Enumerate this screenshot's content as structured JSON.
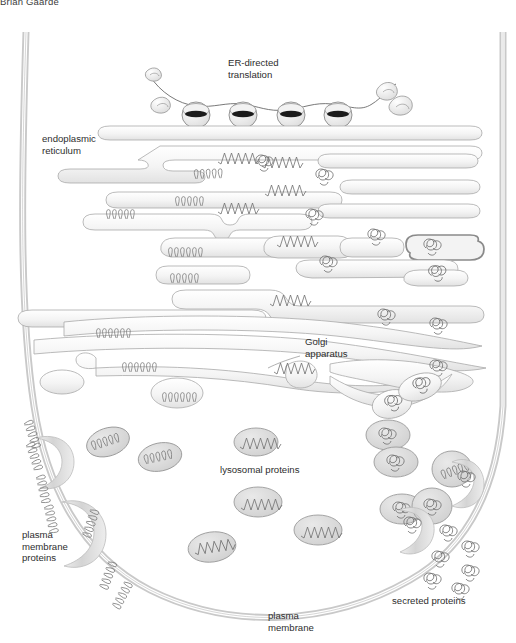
{
  "breadcrumb": {
    "text": "Brian Gaarde"
  },
  "figure": {
    "background_color": "#ffffff",
    "ink_color": "#6e6e6e",
    "membrane_fill": "#dcdcdc",
    "vesicle_fill": "#d6d6d6",
    "label_color": "#2e2e2e",
    "labels": [
      {
        "id": "er-directed-translation",
        "line1": "ER-directed",
        "line2": "translation",
        "x": 228,
        "y": 52
      },
      {
        "id": "endoplasmic-reticulum",
        "line1": "endoplasmic",
        "line2": "reticulum",
        "x": 42,
        "y": 128
      },
      {
        "id": "golgi-apparatus",
        "line1": "Golgi",
        "line2": "apparatus",
        "x": 305,
        "y": 331
      },
      {
        "id": "lysosomal-proteins",
        "line1": "lysosomal proteins",
        "line2": "",
        "x": 220,
        "y": 459
      },
      {
        "id": "plasma-membrane-proteins",
        "line1": "plasma",
        "line2": "membrane",
        "line3": "proteins",
        "x": 22,
        "y": 524
      },
      {
        "id": "secreted-proteins",
        "line1": "secreted proteins",
        "line2": "",
        "x": 392,
        "y": 590
      },
      {
        "id": "plasma-membrane",
        "line1": "plasma",
        "line2": "membrane",
        "x": 268,
        "y": 605
      }
    ],
    "structures": {
      "ribosome_count": 4,
      "er_cisterna_count": 14,
      "golgi_cisterna_count": 5,
      "vesicle_count": 14,
      "free_protein_count": 14
    },
    "protein_motifs": [
      {
        "id": "coil-motif",
        "name": "membrane protein (alpha-helical coil)"
      },
      {
        "id": "zigzag-motif",
        "name": "lysosomal protein (zigzag)"
      },
      {
        "id": "tangle-motif",
        "name": "secreted protein (tangled globule)"
      }
    ]
  }
}
